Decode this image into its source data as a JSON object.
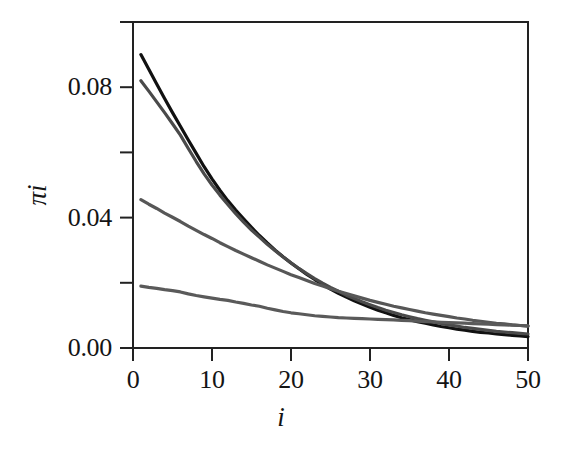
{
  "chart_data": {
    "type": "line",
    "title": "",
    "subtitle": "",
    "xlabel": "i",
    "ylabel": "πi",
    "xlim": [
      0,
      50
    ],
    "ylim": [
      0.0,
      0.1
    ],
    "grid": false,
    "legend": "none",
    "x_ticks": [
      {
        "value": 0,
        "label": "0"
      },
      {
        "value": 10,
        "label": "10"
      },
      {
        "value": 20,
        "label": "20"
      },
      {
        "value": 30,
        "label": "30"
      },
      {
        "value": 40,
        "label": "40"
      },
      {
        "value": 50,
        "label": "50"
      }
    ],
    "y_ticks": [
      {
        "value": 0.0,
        "label": "0.00"
      },
      {
        "value": 0.02,
        "label": ""
      },
      {
        "value": 0.04,
        "label": "0.04"
      },
      {
        "value": 0.06,
        "label": ""
      },
      {
        "value": 0.08,
        "label": "0.08"
      },
      {
        "value": 0.1,
        "label": ""
      }
    ],
    "x": [
      1,
      2,
      3,
      4,
      5,
      6,
      7,
      8,
      9,
      10,
      11,
      12,
      13,
      14,
      15,
      16,
      17,
      18,
      19,
      20,
      21,
      22,
      23,
      24,
      25,
      26,
      27,
      28,
      29,
      30,
      31,
      32,
      33,
      34,
      35,
      36,
      37,
      38,
      39,
      40,
      41,
      42,
      43,
      44,
      45,
      46,
      47,
      48,
      49,
      50
    ],
    "series": [
      {
        "name": "curve-1",
        "color": "#111111",
        "width": 3.2,
        "values": [
          0.09,
          0.0855,
          0.081,
          0.0765,
          0.0722,
          0.068,
          0.0638,
          0.0597,
          0.0556,
          0.0519,
          0.0484,
          0.0452,
          0.0423,
          0.0396,
          0.037,
          0.0345,
          0.0322,
          0.03,
          0.028,
          0.0261,
          0.0243,
          0.0226,
          0.021,
          0.0195,
          0.0181,
          0.0168,
          0.0156,
          0.0145,
          0.0135,
          0.0125,
          0.0116,
          0.0108,
          0.01,
          0.0093,
          0.0087,
          0.0081,
          0.0076,
          0.0071,
          0.0066,
          0.0062,
          0.0058,
          0.0055,
          0.0051,
          0.0048,
          0.0046,
          0.0043,
          0.0041,
          0.0039,
          0.0037,
          0.0035
        ]
      },
      {
        "name": "curve-2",
        "color": "#4a4a4a",
        "width": 3.2,
        "values": [
          0.082,
          0.0788,
          0.0755,
          0.0722,
          0.0688,
          0.0653,
          0.0612,
          0.0572,
          0.0534,
          0.05,
          0.0469,
          0.044,
          0.0412,
          0.0386,
          0.0362,
          0.034,
          0.0318,
          0.0298,
          0.0279,
          0.0261,
          0.0244,
          0.0228,
          0.0213,
          0.0199,
          0.0186,
          0.0174,
          0.0162,
          0.0152,
          0.0142,
          0.0133,
          0.0124,
          0.0116,
          0.0109,
          0.0102,
          0.0096,
          0.009,
          0.0085,
          0.008,
          0.0075,
          0.0071,
          0.0067,
          0.0063,
          0.006,
          0.0057,
          0.0054,
          0.0051,
          0.0049,
          0.0047,
          0.0045,
          0.0043
        ]
      },
      {
        "name": "curve-3",
        "color": "#575757",
        "width": 3.2,
        "values": [
          0.0455,
          0.0441,
          0.0428,
          0.0414,
          0.0401,
          0.0388,
          0.0374,
          0.0361,
          0.0348,
          0.0336,
          0.0323,
          0.0311,
          0.0299,
          0.0288,
          0.0277,
          0.0266,
          0.0255,
          0.0245,
          0.0235,
          0.0225,
          0.0216,
          0.0207,
          0.0198,
          0.019,
          0.0182,
          0.0174,
          0.0167,
          0.016,
          0.0153,
          0.0146,
          0.014,
          0.0134,
          0.0128,
          0.0123,
          0.0118,
          0.0113,
          0.0108,
          0.0104,
          0.01,
          0.0096,
          0.0092,
          0.0089,
          0.0085,
          0.0082,
          0.0079,
          0.0076,
          0.0074,
          0.0071,
          0.0069,
          0.0067
        ]
      },
      {
        "name": "curve-4",
        "color": "#5a5a5a",
        "width": 3.2,
        "values": [
          0.019,
          0.0186,
          0.0183,
          0.0179,
          0.0176,
          0.0172,
          0.0166,
          0.0161,
          0.0157,
          0.0153,
          0.0149,
          0.0146,
          0.0141,
          0.0137,
          0.0132,
          0.0128,
          0.0122,
          0.0117,
          0.0112,
          0.0108,
          0.0105,
          0.0102,
          0.0099,
          0.0097,
          0.0095,
          0.0093,
          0.0092,
          0.0091,
          0.009,
          0.0089,
          0.0088,
          0.0087,
          0.0086,
          0.0085,
          0.0084,
          0.0082,
          0.0081,
          0.008,
          0.0079,
          0.0078,
          0.0077,
          0.0076,
          0.0075,
          0.0074,
          0.0073,
          0.0072,
          0.0071,
          0.007,
          0.0069,
          0.0068
        ]
      }
    ]
  },
  "axes": {
    "frame_color": "#222222",
    "background": "#ffffff"
  }
}
